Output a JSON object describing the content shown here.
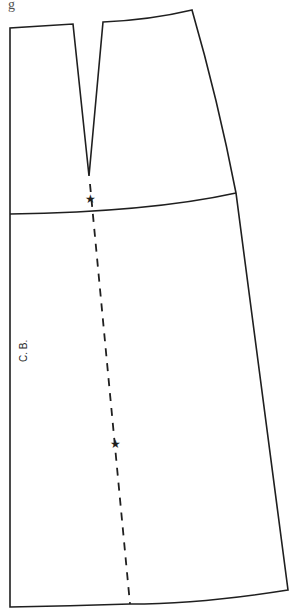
{
  "figure": {
    "type": "sewing-pattern",
    "cropped_caption_fragment": "g",
    "labels": {
      "center_back": "C. B."
    },
    "markers": [
      {
        "name": "notch-star-hip",
        "glyph": "★",
        "x": 91,
        "y": 199
      },
      {
        "name": "notch-star-mid",
        "glyph": "★",
        "x": 116,
        "y": 444
      }
    ],
    "lines": {
      "outline": "solid",
      "hip_line": "solid",
      "grainline": "dashed"
    },
    "colors": {
      "line": "#1f1f1f",
      "background": "#ffffff"
    }
  }
}
